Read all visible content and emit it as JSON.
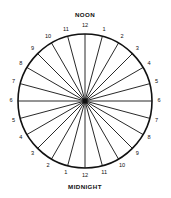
{
  "figure": {
    "title_top": "NOON",
    "title_bottom": "MIDNIGHT",
    "stroke_color": "#111111",
    "background_color": "#ffffff"
  },
  "chart_data": {
    "type": "pie",
    "subtitle": "",
    "xlabel": "",
    "ylabel": "",
    "grid": false,
    "legend_position": "none",
    "center_x": 85,
    "center_y": 101,
    "radius": 67,
    "slice_count": 24,
    "slice_degrees": 15,
    "values": [
      15,
      15,
      15,
      15,
      15,
      15,
      15,
      15,
      15,
      15,
      15,
      15,
      15,
      15,
      15,
      15,
      15,
      15,
      15,
      15,
      15,
      15,
      15,
      15
    ],
    "annotations": [
      {
        "text": "NOON",
        "position": "top-outside",
        "angle_deg": 0
      },
      {
        "text": "MIDNIGHT",
        "position": "bottom-outside",
        "angle_deg": 180
      }
    ],
    "categories": [
      {
        "label": "12",
        "angle_deg": 0,
        "side": "top"
      },
      {
        "label": "1",
        "angle_deg": 15,
        "side": "right"
      },
      {
        "label": "2",
        "angle_deg": 30,
        "side": "right"
      },
      {
        "label": "3",
        "angle_deg": 45,
        "side": "right"
      },
      {
        "label": "4",
        "angle_deg": 60,
        "side": "right"
      },
      {
        "label": "5",
        "angle_deg": 75,
        "side": "right"
      },
      {
        "label": "6",
        "angle_deg": 90,
        "side": "right"
      },
      {
        "label": "7",
        "angle_deg": 105,
        "side": "right"
      },
      {
        "label": "8",
        "angle_deg": 120,
        "side": "right"
      },
      {
        "label": "9",
        "angle_deg": 135,
        "side": "right"
      },
      {
        "label": "10",
        "angle_deg": 150,
        "side": "right"
      },
      {
        "label": "11",
        "angle_deg": 165,
        "side": "right"
      },
      {
        "label": "12",
        "angle_deg": 180,
        "side": "bottom"
      },
      {
        "label": "1",
        "angle_deg": 195,
        "side": "left"
      },
      {
        "label": "2",
        "angle_deg": 210,
        "side": "left"
      },
      {
        "label": "3",
        "angle_deg": 225,
        "side": "left"
      },
      {
        "label": "4",
        "angle_deg": 240,
        "side": "left"
      },
      {
        "label": "5",
        "angle_deg": 255,
        "side": "left"
      },
      {
        "label": "6",
        "angle_deg": 270,
        "side": "left"
      },
      {
        "label": "7",
        "angle_deg": 285,
        "side": "left"
      },
      {
        "label": "8",
        "angle_deg": 300,
        "side": "left"
      },
      {
        "label": "9",
        "angle_deg": 315,
        "side": "left"
      },
      {
        "label": "10",
        "angle_deg": 330,
        "side": "left"
      },
      {
        "label": "11",
        "angle_deg": 345,
        "side": "left"
      }
    ]
  }
}
